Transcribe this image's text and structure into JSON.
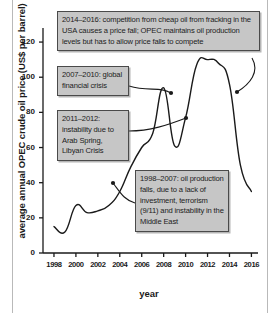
{
  "chart_data": {
    "type": "line",
    "title": "",
    "xlabel": "year",
    "ylabel": "average annual OPEC crude oil price (US$ per barrel)",
    "xlim": [
      1997,
      2016.6
    ],
    "ylim": [
      0,
      128
    ],
    "grid": false,
    "legend": "none",
    "xticks": [
      "1998",
      "2000",
      "2002",
      "2004",
      "2006",
      "2008",
      "2010",
      "2012",
      "2014",
      "2016"
    ],
    "yticks": [
      "0",
      "20",
      "40",
      "60",
      "80",
      "100",
      "120"
    ],
    "x": [
      1998,
      1999,
      2000,
      2001,
      2002,
      2003,
      2004,
      2005,
      2006,
      2007,
      2008,
      2009,
      2010,
      2011,
      2012,
      2013,
      2014,
      2015,
      2016
    ],
    "values": [
      15,
      12,
      27,
      23,
      24,
      27,
      35,
      49,
      60,
      68,
      94,
      61,
      77,
      107,
      110,
      108,
      96,
      50,
      35
    ],
    "annotations": [
      {
        "id": "fracking-price-fall",
        "text": "2014–2016: competition from cheap oil from fracking in the USA causes a price fall; OPEC maintains oil production levels but has to allow price falls to compete",
        "points_to_year": 2015
      },
      {
        "id": "global-financial-crisis",
        "text": "2007–2010: global financial crisis",
        "points_to_year": 2008
      },
      {
        "id": "arab-spring-libyan-crisis",
        "text": "2011–2012: instability due to Arab Spring, Libyan Crisis",
        "points_to_year": 2010
      },
      {
        "id": "production-falls-terrorism",
        "text": "1998–2007: oil production falls, due to a lack of investment, terrorism (9/11) and instability in the Middle East",
        "points_to_year": 2004
      }
    ]
  }
}
